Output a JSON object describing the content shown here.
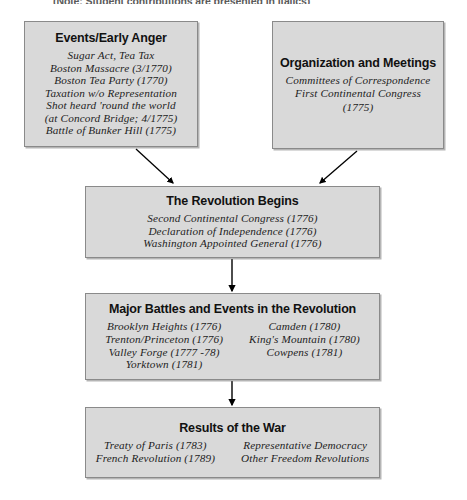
{
  "diagram": {
    "note": "(Note: Student contributions are presented in italics)",
    "colors": {
      "box_fill": "#d9d9d9",
      "box_border": "#8a8a8a",
      "text": "#1a1a1a",
      "arrow": "#000000"
    },
    "boxes": [
      {
        "id": "events",
        "title": "Events/Early Anger",
        "lines": [
          "Sugar Act, Tea Tax",
          "Boston Massacre (3/1770)",
          "Boston Tea Party (1770)",
          "Taxation w/o Representation",
          "Shot heard 'round the world",
          "(at Concord Bridge; 4/1775)",
          "Battle of Bunker Hill (1775)"
        ]
      },
      {
        "id": "organization",
        "title": "Organization and Meetings",
        "lines": [
          "Committees of Correspondence",
          "First Continental Congress",
          "(1775)"
        ]
      },
      {
        "id": "revolution",
        "title": "The Revolution Begins",
        "lines": [
          "Second Continental Congress (1776)",
          "Declaration of Independence (1776)",
          "Washington Appointed General (1776)"
        ]
      },
      {
        "id": "battles",
        "title": "Major Battles and Events in the Revolution",
        "columns": [
          {
            "lines": [
              "Brooklyn Heights (1776)",
              "Trenton/Princeton (1776)",
              "Valley Forge (1777 -78)",
              "Yorktown (1781)"
            ]
          },
          {
            "lines": [
              "Camden (1780)",
              "King's Mountain (1780)",
              "Cowpens (1781)"
            ]
          }
        ]
      },
      {
        "id": "results",
        "title": "Results of the War",
        "columns": [
          {
            "lines": [
              "Treaty of Paris (1783)",
              "French Revolution (1789)"
            ]
          },
          {
            "lines": [
              "Representative Democracy",
              "Other Freedom Revolutions"
            ]
          }
        ]
      }
    ],
    "connectors": [
      {
        "from": "events",
        "to": "revolution",
        "type": "diagonal-arrow"
      },
      {
        "from": "organization",
        "to": "revolution",
        "type": "diagonal-arrow"
      },
      {
        "from": "revolution",
        "to": "battles",
        "type": "vertical-arrow"
      },
      {
        "from": "battles",
        "to": "results",
        "type": "vertical-arrow"
      }
    ]
  }
}
